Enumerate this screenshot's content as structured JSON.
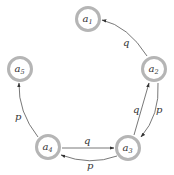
{
  "diagram": {
    "type": "state-transition-graph",
    "colors": {
      "node_ring": "#b5b5b5",
      "edge": "#555555",
      "text": "#333333"
    },
    "nodes": [
      {
        "id": "a1",
        "base": "a",
        "sub": "1",
        "x": 88,
        "y": 19
      },
      {
        "id": "a2",
        "base": "a",
        "sub": "2",
        "x": 154,
        "y": 69
      },
      {
        "id": "a3",
        "base": "a",
        "sub": "3",
        "x": 128,
        "y": 148
      },
      {
        "id": "a4",
        "base": "a",
        "sub": "4",
        "x": 48,
        "y": 147
      },
      {
        "id": "a5",
        "base": "a",
        "sub": "5",
        "x": 20,
        "y": 69
      }
    ],
    "edges": [
      {
        "from": "a2",
        "to": "a1",
        "label": "q"
      },
      {
        "from": "a3",
        "to": "a2",
        "label": "q"
      },
      {
        "from": "a2",
        "to": "a3",
        "label": "p"
      },
      {
        "from": "a4",
        "to": "a3",
        "label": "q"
      },
      {
        "from": "a3",
        "to": "a4",
        "label": "p"
      },
      {
        "from": "a4",
        "to": "a5",
        "label": "p"
      }
    ]
  }
}
